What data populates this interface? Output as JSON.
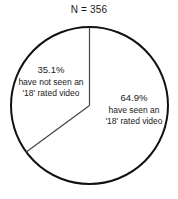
{
  "chart_data": {
    "type": "pie",
    "title": "N = 356",
    "xlabel": "",
    "ylabel": "",
    "total_n": 356,
    "legend_position": "none",
    "grid": false,
    "start_angle_deg": 0,
    "direction": "clockwise",
    "categories": [
      "have seen an '18' rated video",
      "have not seen an '18' rated video"
    ],
    "values": [
      64.9,
      35.1
    ],
    "slices": [
      {
        "name": "seen-18-rated",
        "percent_label": "64.9%",
        "value": 64.9,
        "line1": "have seen an",
        "line2": "'18' rated video",
        "fill": "#ffffff",
        "stroke": "#111111"
      },
      {
        "name": "not-seen-18-rated",
        "percent_label": "35.1%",
        "value": 35.1,
        "line1": "have not seen an",
        "line2": "'18' rated video",
        "fill": "#ffffff",
        "stroke": "#111111"
      }
    ]
  },
  "chart": {
    "title": "N = 356",
    "outline_color": "#111111",
    "divider_color": "#444444",
    "background": "#ffffff",
    "left_slice": {
      "percent": "35.1%",
      "line1": "have not seen an",
      "line2": "'18' rated video"
    },
    "right_slice": {
      "percent": "64.9%",
      "line1": "have seen an",
      "line2": "'18' rated video"
    }
  }
}
